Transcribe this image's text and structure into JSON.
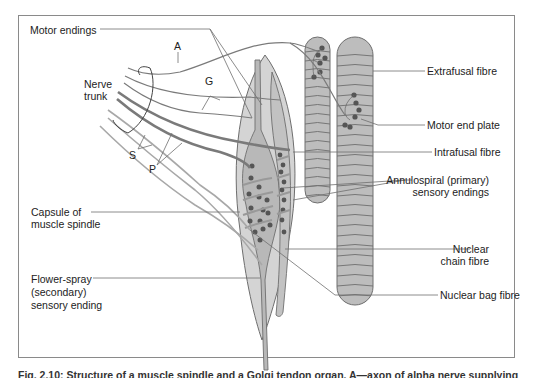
{
  "figure": {
    "colors": {
      "line": "#6e6e6e",
      "fibre_fill": "#bdbdbd",
      "capsule_fill": "#d4d4d4",
      "intrafusal_fill": "#b8b8b8",
      "nucleus": "#555555",
      "text": "#222222"
    },
    "labels_left": {
      "motor_endings": "Motor endings",
      "nerve_trunk_line1": "Nerve",
      "nerve_trunk_line2": "trunk",
      "capsule_line1": "Capsule of",
      "capsule_line2": "muscle spindle",
      "flower_spray_line1": "Flower-spray",
      "flower_spray_line2": "(secondary)",
      "flower_spray_line3": "sensory ending"
    },
    "labels_right": {
      "extrafusal": "Extrafusal fibre",
      "motor_end_plate": "Motor end plate",
      "intrafusal": "Intrafusal fibre",
      "annulospiral_line1": "Annulospiral (primary)",
      "annulospiral_line2": "sensory endings",
      "nuclear_chain_line1": "Nuclear",
      "nuclear_chain_line2": "chain fibre",
      "nuclear_bag": "Nuclear bag fibre"
    },
    "letters": {
      "A": "A",
      "G": "G",
      "S": "S",
      "P": "P"
    },
    "caption": "Fig. 2.10: Structure of a muscle spindle and a Golgi tendon organ. A—axon of alpha nerve supplying"
  }
}
